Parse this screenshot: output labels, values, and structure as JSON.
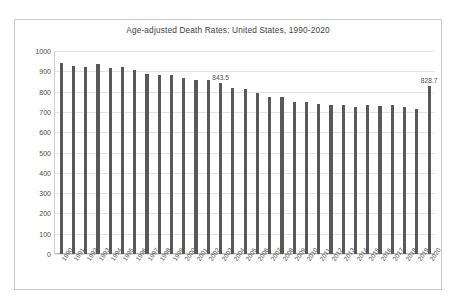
{
  "chart_data": {
    "type": "bar",
    "title": "Age-adjusted Death Rates: United States, 1990-2020",
    "xlabel": "",
    "ylabel": "",
    "ylim": [
      0,
      1000
    ],
    "ytick_step": 100,
    "yticks": [
      "1000",
      "900",
      "800",
      "700",
      "600",
      "500",
      "400",
      "300",
      "200",
      "100",
      "0"
    ],
    "grid": true,
    "legend": "none",
    "bar_color": "#595959",
    "categories": [
      "1990",
      "1991",
      "1992",
      "1993",
      "1994",
      "1995",
      "1996",
      "1997",
      "1998",
      "1999",
      "2000",
      "2001",
      "2002",
      "2003",
      "2004",
      "2005",
      "2006",
      "2007",
      "2008",
      "2009",
      "2010",
      "2011",
      "2012",
      "2013",
      "2014",
      "2015",
      "2016",
      "2017",
      "2018",
      "2019",
      "2020"
    ],
    "values": [
      938.7,
      926.0,
      919.6,
      938.4,
      917.6,
      919.4,
      906.4,
      888.2,
      883.1,
      881.9,
      869.0,
      858.8,
      855.9,
      843.5,
      816.5,
      815.0,
      791.8,
      775.3,
      774.9,
      749.6,
      747.0,
      741.3,
      732.8,
      731.9,
      724.6,
      733.1,
      728.8,
      731.9,
      723.6,
      715.2,
      828.7
    ],
    "annotations": [
      {
        "category": "2003",
        "value": 843.5,
        "text": "843.5"
      },
      {
        "category": "2020",
        "value": 828.7,
        "text": "828.7"
      }
    ]
  }
}
